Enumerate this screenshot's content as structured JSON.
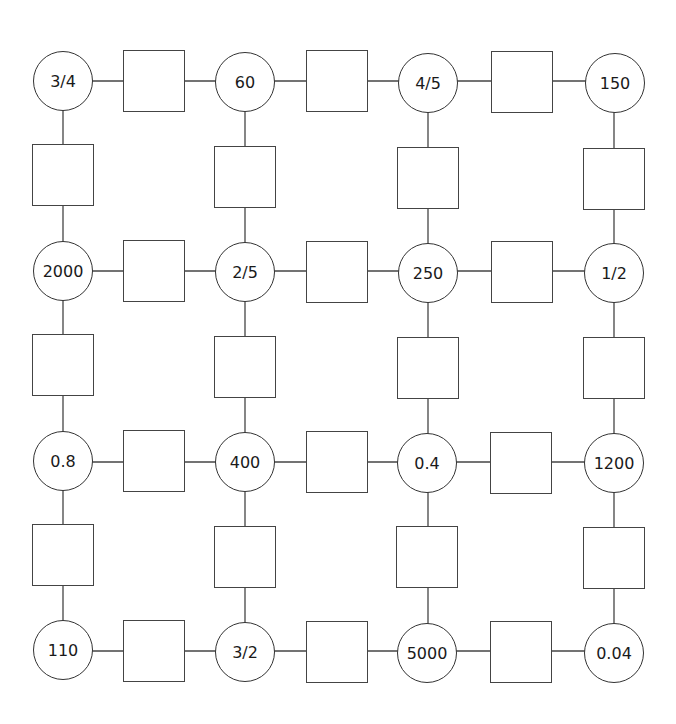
{
  "diagram": {
    "type": "grid-puzzle",
    "rows": 4,
    "cols": 4,
    "columns_x": [
      63,
      245,
      428,
      614
    ],
    "rows_y": [
      81,
      271,
      462,
      651
    ],
    "nodes": [
      [
        "3/4",
        "60",
        "4/5",
        "150"
      ],
      [
        "2000",
        "2/5",
        "250",
        "1/2"
      ],
      [
        "0.8",
        "400",
        "0.4",
        "1200"
      ],
      [
        "110",
        "3/2",
        "5000",
        "0.04"
      ]
    ],
    "answer_boxes": {
      "horizontal_per_row": 3,
      "vertical_per_col": 3,
      "values": ""
    },
    "colors": {
      "stroke": "#333333",
      "background": "#ffffff",
      "text": "#1a1a1a"
    }
  }
}
